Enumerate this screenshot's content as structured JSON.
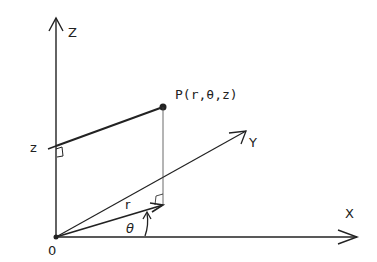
{
  "diagram": {
    "type": "cylindrical-coordinates",
    "axes": {
      "z_label": "Z",
      "x_label": "X",
      "y_label": "Y",
      "origin_label": "0"
    },
    "point": {
      "label": "P(r,θ,z)"
    },
    "annotations": {
      "z_height_label": "z",
      "radius_label": "r",
      "angle_label": "θ"
    },
    "colors": {
      "line": "#222222",
      "background": "#ffffff"
    }
  }
}
